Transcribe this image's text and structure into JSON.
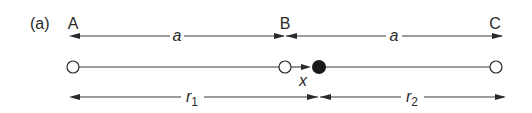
{
  "figure": {
    "panel_label": "(a)",
    "points": [
      {
        "name": "A",
        "x": 73,
        "type": "open"
      },
      {
        "name": "B",
        "x": 285,
        "type": "open"
      },
      {
        "name": "C",
        "x": 496,
        "type": "open"
      }
    ],
    "moving_charge": {
      "x": 319,
      "type": "filled",
      "displacement_label": "x"
    },
    "dimensions": {
      "top": [
        {
          "label": "a",
          "from": "A",
          "to": "B"
        },
        {
          "label": "a",
          "from": "B",
          "to": "C"
        }
      ],
      "bottom": [
        {
          "label": "r",
          "sub": "1",
          "from": "A",
          "to": "charge"
        },
        {
          "label": "r",
          "sub": "2",
          "from": "charge",
          "to": "C"
        }
      ]
    },
    "colors": {
      "ink": "#2a2a2a",
      "background": "#ffffff"
    }
  },
  "labels": {
    "panel": "(a)",
    "A": "A",
    "B": "B",
    "C": "C",
    "a1": "a",
    "a2": "a",
    "x": "x",
    "r1": "r",
    "r1_sub": "1",
    "r2": "r",
    "r2_sub": "2"
  }
}
